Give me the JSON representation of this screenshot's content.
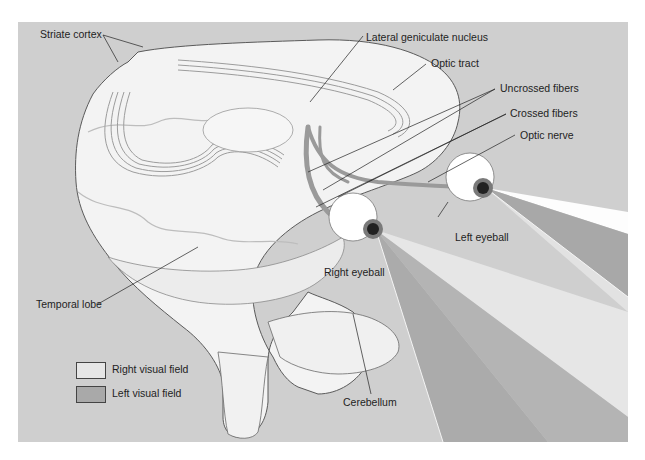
{
  "figure": {
    "background_color": "#cfcfcf"
  },
  "labels": {
    "striate_cortex": "Striate cortex",
    "lateral_geniculate_nucleus": "Lateral geniculate nucleus",
    "optic_tract": "Optic tract",
    "uncrossed_fibers": "Uncrossed fibers",
    "crossed_fibers": "Crossed fibers",
    "optic_nerve": "Optic nerve",
    "left_eyeball": "Left eyeball",
    "right_eyeball": "Right eyeball",
    "temporal_lobe": "Temporal lobe",
    "cerebellum": "Cerebellum"
  },
  "legend": {
    "items": [
      {
        "label": "Right visual field",
        "color": "#e6e6e6"
      },
      {
        "label": "Left visual field",
        "color": "#a9a9a9"
      }
    ]
  },
  "colors": {
    "brain_fill": "#f2f2f2",
    "brain_outline": "#555555",
    "nerve": "#9a9a9a",
    "iris": "#6d6d6d",
    "pupil": "#111111",
    "field_light": "#e8e8e8",
    "field_dark": "#a8a8a8"
  }
}
